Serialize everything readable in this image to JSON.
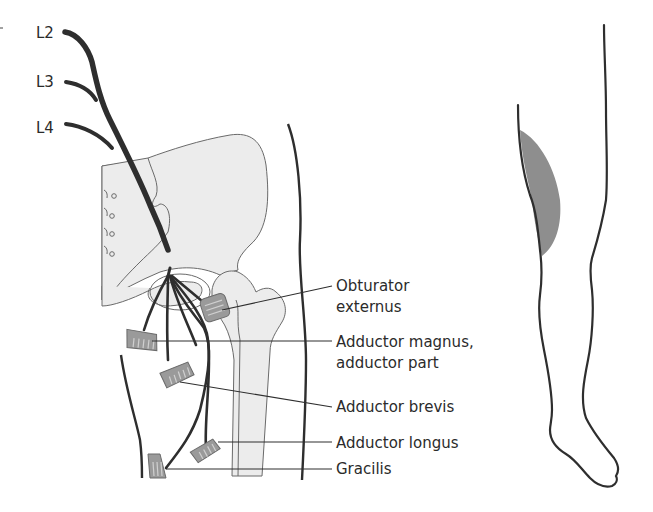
{
  "colors": {
    "nerve": "#2e2e2e",
    "bone_fill": "#ececec",
    "bone_stroke": "#6a6a6a",
    "muscle_fill": "#9a9a9a",
    "sensory_area": "#8e8e8e",
    "outline": "#2e2e2e",
    "text": "#2b2b2b"
  },
  "nerve_roots": [
    {
      "label": "L2"
    },
    {
      "label": "L3"
    },
    {
      "label": "L4"
    }
  ],
  "muscles": [
    {
      "label_line1": "Obturator",
      "label_line2": "externus"
    },
    {
      "label_line1": "Adductor magnus,",
      "label_line2": "adductor part"
    },
    {
      "label_line1": "Adductor brevis",
      "label_line2": ""
    },
    {
      "label_line1": "Adductor longus",
      "label_line2": ""
    },
    {
      "label_line1": "Gracilis",
      "label_line2": ""
    }
  ],
  "leg_figure": {
    "description": "sensory-area"
  }
}
